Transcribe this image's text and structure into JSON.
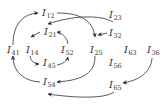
{
  "diagram": {
    "type": "directed-graph",
    "nodes": [
      {
        "id": "I12",
        "base": "I",
        "sub": "12",
        "x": 42,
        "y": 16
      },
      {
        "id": "I23",
        "base": "I",
        "sub": "23",
        "x": 109,
        "y": 18
      },
      {
        "id": "I21",
        "base": "I",
        "sub": "21",
        "x": 44,
        "y": 35
      },
      {
        "id": "I32",
        "base": "I",
        "sub": "32",
        "x": 109,
        "y": 36
      },
      {
        "id": "I41",
        "base": "I",
        "sub": "41",
        "x": 7,
        "y": 53
      },
      {
        "id": "I14",
        "base": "I",
        "sub": "14",
        "x": 26,
        "y": 53
      },
      {
        "id": "I52",
        "base": "I",
        "sub": "52",
        "x": 61,
        "y": 53
      },
      {
        "id": "I25",
        "base": "I",
        "sub": "25",
        "x": 90,
        "y": 53
      },
      {
        "id": "I63",
        "base": "I",
        "sub": "63",
        "x": 124,
        "y": 53
      },
      {
        "id": "I36",
        "base": "I",
        "sub": "36",
        "x": 147,
        "y": 53
      },
      {
        "id": "I45",
        "base": "I",
        "sub": "45",
        "x": 43,
        "y": 66
      },
      {
        "id": "I56",
        "base": "I",
        "sub": "56",
        "x": 109,
        "y": 66
      },
      {
        "id": "I54",
        "base": "I",
        "sub": "54",
        "x": 43,
        "y": 85
      },
      {
        "id": "I65",
        "base": "I",
        "sub": "65",
        "x": 109,
        "y": 88
      }
    ],
    "edges": [
      {
        "from": "I41",
        "to": "I12",
        "path": "M 13 45 C 13 25, 22 14, 38 13"
      },
      {
        "from": "I12",
        "to": "I25",
        "path": "M 57 13 C 80 13, 93 20, 95 37"
      },
      {
        "from": "I23",
        "to": "I21",
        "path": "M 113 22 C 100 14, 70 16, 48 24"
      },
      {
        "from": "I32",
        "to": "I25",
        "path": "M 107 33 L 98 35"
      },
      {
        "from": "I21",
        "to": "I14",
        "path": "M 40 32 L 31 37"
      },
      {
        "from": "I52",
        "to": "I21",
        "path": "M 68 44 C 67 38, 63 33, 57 32"
      },
      {
        "from": "I14",
        "to": "I45",
        "path": "M 30 56 C 31 61, 34 64, 39 64"
      },
      {
        "from": "I45",
        "to": "I52",
        "path": "M 57 65 C 63 64, 67 61, 68 57"
      },
      {
        "from": "I25",
        "to": "I54",
        "path": "M 95 56 C 95 72, 85 80, 57 82"
      },
      {
        "from": "I54",
        "to": "I41",
        "path": "M 40 82 C 24 81, 13 72, 13 56"
      },
      {
        "from": "I36",
        "to": "I65",
        "path": "M 152 58 C 151 72, 140 80, 123 83"
      },
      {
        "from": "I65",
        "to": "I54",
        "path": "M 114 92 C 105 99, 75 98, 48 94"
      }
    ]
  }
}
